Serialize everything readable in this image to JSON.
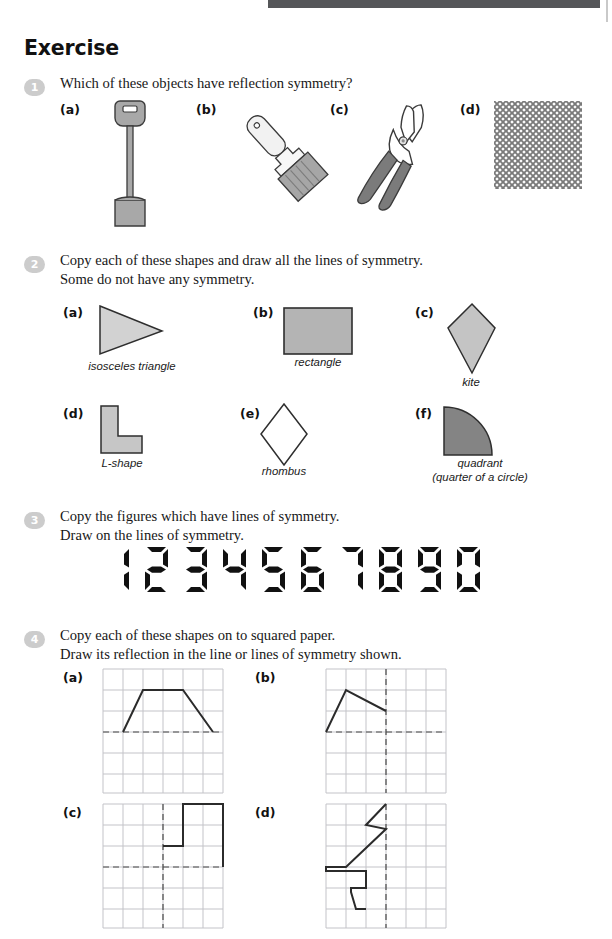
{
  "page": {
    "heading": "Exercise",
    "accent_bar_color": "#555659",
    "bullet_color": "#cccccc"
  },
  "questions": [
    {
      "number": "1",
      "text": "Which of these objects have reflection symmetry?",
      "parts": [
        {
          "label": "(a)",
          "object": "spade-icon"
        },
        {
          "label": "(b)",
          "object": "paintbrush-icon"
        },
        {
          "label": "(c)",
          "object": "scissors-icon"
        },
        {
          "label": "(d)",
          "object": "mesh-pattern-icon"
        }
      ]
    },
    {
      "number": "2",
      "text": "Copy each of these shapes and draw all the lines of symmetry.\nSome do not have any symmetry.",
      "parts": [
        {
          "label": "(a)",
          "caption": "isosceles triangle",
          "shape": "triangle",
          "fill": "#d2d2d2"
        },
        {
          "label": "(b)",
          "caption": "rectangle",
          "shape": "rectangle",
          "fill": "#b4b4b4"
        },
        {
          "label": "(c)",
          "caption": "kite",
          "shape": "kite",
          "fill": "#c4c4c4"
        },
        {
          "label": "(d)",
          "caption": "L-shape",
          "shape": "l-shape",
          "fill": "#c6c6c6"
        },
        {
          "label": "(e)",
          "caption": "rhombus",
          "shape": "rhombus",
          "fill": "#ffffff"
        },
        {
          "label": "(f)",
          "caption": "quadrant\n(quarter of a circle)",
          "shape": "quadrant",
          "fill": "#848484"
        }
      ]
    },
    {
      "number": "3",
      "text": "Copy the figures which have lines of symmetry.\nDraw on the lines of symmetry.",
      "digits": [
        "1",
        "2",
        "3",
        "4",
        "5",
        "6",
        "7",
        "8",
        "9",
        "0"
      ]
    },
    {
      "number": "4",
      "text": "Copy each of these shapes on to squared paper.\nDraw its reflection in the line or lines of symmetry shown.",
      "parts": [
        {
          "label": "(a)",
          "grid": "6x6",
          "mirror": "horizontal",
          "shape": "trapezium"
        },
        {
          "label": "(b)",
          "grid": "6x6",
          "mirror": "horizontal-and-vertical",
          "shape": "triangle-wedge"
        },
        {
          "label": "(c)",
          "grid": "6x6",
          "mirror": "horizontal-and-vertical",
          "shape": "step-block"
        },
        {
          "label": "(d)",
          "grid": "6x6",
          "mirror": "vertical",
          "shape": "zigzag-bolt"
        }
      ]
    }
  ]
}
